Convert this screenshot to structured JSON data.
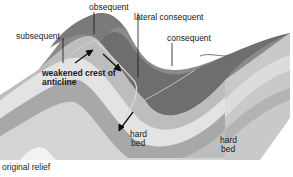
{
  "diagram": {
    "caption": "original relief",
    "labels": {
      "obsequent": "obsequent",
      "lateral_consequent": "lateral consequent",
      "consequent": "consequent",
      "subsequent": "subsequent",
      "weakened_crest_line1": "weakened crest of",
      "weakened_crest_line2": "anticline",
      "hard_bed_left_line1": "hard",
      "hard_bed_left_line2": "bed",
      "hard_bed_right_line1": "hard",
      "hard_bed_right_line2": "bed"
    },
    "colors": {
      "surface_dark": "#6e6e6e",
      "surface_mid": "#8a8a8a",
      "layer_light": "#e6e6e6",
      "layer_mid": "#bdbdbd",
      "layer_dark": "#9e9e9e",
      "side_face": "#c4c4c4",
      "text": "#1a1a1a"
    }
  }
}
